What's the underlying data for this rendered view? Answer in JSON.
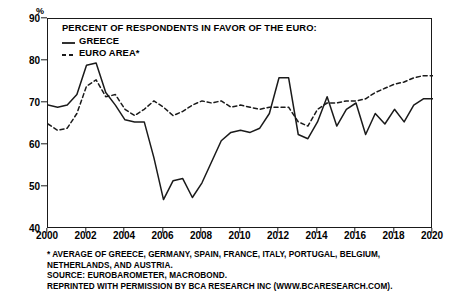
{
  "chart_data": {
    "type": "line",
    "title": "PERCENT OF RESPONDENTS IN FAVOR OF THE EURO:",
    "xlabel": "",
    "ylabel": "%",
    "ylim": [
      40,
      90
    ],
    "xlim": [
      2000,
      2020
    ],
    "yticks": [
      40,
      50,
      60,
      70,
      80,
      90
    ],
    "xticks": [
      2000,
      2002,
      2004,
      2006,
      2008,
      2010,
      2012,
      2014,
      2016,
      2018,
      2020
    ],
    "grid": false,
    "legend_position": "top-left",
    "series": [
      {
        "name": "GREECE",
        "style": "solid",
        "color": "#1a1a1a",
        "x": [
          2000.0,
          2000.5,
          2001.0,
          2001.5,
          2002.0,
          2002.5,
          2003.0,
          2003.5,
          2004.0,
          2004.5,
          2005.0,
          2005.5,
          2006.0,
          2006.5,
          2007.0,
          2007.5,
          2008.0,
          2008.5,
          2009.0,
          2009.5,
          2010.0,
          2010.5,
          2011.0,
          2011.5,
          2012.0,
          2012.5,
          2013.0,
          2013.5,
          2014.0,
          2014.5,
          2015.0,
          2015.5,
          2016.0,
          2016.5,
          2017.0,
          2017.5,
          2018.0,
          2018.5,
          2019.0,
          2019.5,
          2020.0
        ],
        "values": [
          69.5,
          69.0,
          69.5,
          72.0,
          79.0,
          79.5,
          72.5,
          69.5,
          66.0,
          65.5,
          65.5,
          57.0,
          47.0,
          51.5,
          52.0,
          47.5,
          51.0,
          56.0,
          61.0,
          63.0,
          63.5,
          63.0,
          64.0,
          67.5,
          76.0,
          76.0,
          62.5,
          61.5,
          65.5,
          71.5,
          64.5,
          68.5,
          70.0,
          62.5,
          67.5,
          65.0,
          68.5,
          65.5,
          69.5,
          71.0,
          71.0
        ]
      },
      {
        "name": "EURO AREA*",
        "style": "dashed",
        "color": "#1a1a1a",
        "x": [
          2000.0,
          2000.5,
          2001.0,
          2001.5,
          2002.0,
          2002.5,
          2003.0,
          2003.5,
          2004.0,
          2004.5,
          2005.0,
          2005.5,
          2006.0,
          2006.5,
          2007.0,
          2007.5,
          2008.0,
          2008.5,
          2009.0,
          2009.5,
          2010.0,
          2010.5,
          2011.0,
          2011.5,
          2012.0,
          2012.5,
          2013.0,
          2013.5,
          2014.0,
          2014.5,
          2015.0,
          2015.5,
          2016.0,
          2016.5,
          2017.0,
          2017.5,
          2018.0,
          2018.5,
          2019.0,
          2019.5,
          2020.0
        ],
        "values": [
          65.0,
          63.5,
          64.0,
          67.5,
          74.0,
          75.5,
          71.5,
          72.0,
          68.5,
          67.0,
          68.5,
          70.5,
          69.0,
          67.0,
          68.0,
          69.5,
          70.5,
          70.0,
          70.5,
          69.0,
          69.5,
          69.0,
          68.5,
          69.0,
          69.0,
          69.0,
          65.5,
          64.5,
          68.5,
          70.0,
          70.0,
          70.5,
          70.5,
          71.0,
          72.5,
          73.5,
          74.5,
          75.0,
          76.0,
          76.5,
          76.5
        ]
      }
    ],
    "annotations": [
      "* AVERAGE OF GREECE, GERMANY, SPAIN, FRANCE, ITALY, PORTUGAL, BELGIUM,",
      "NETHERLANDS, AND AUSTRIA.",
      "SOURCE: EUROBAROMETER, MACROBOND.",
      "REPRINTED WITH PERMISSION BY BCA RESEARCH INC (WWW.BCARESEARCH.COM)."
    ]
  }
}
